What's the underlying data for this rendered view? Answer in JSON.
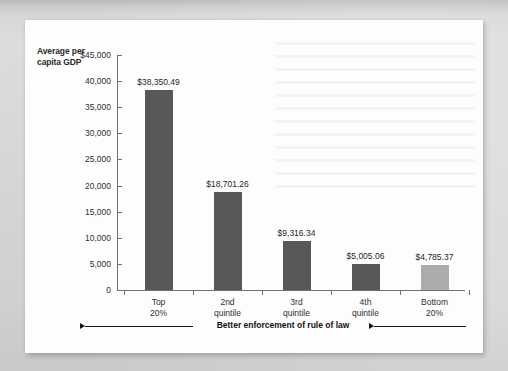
{
  "figure": {
    "y_axis_title": "Average per capita GDP",
    "annotation": "Better enforcement of rule of law"
  },
  "chart_data": {
    "type": "bar",
    "title": "",
    "xlabel": "Better enforcement of rule of law",
    "ylabel": "Average per capita GDP",
    "categories": [
      "Top 20%",
      "2nd quintile",
      "3rd quintile",
      "4th quintile",
      "Bottom 20%"
    ],
    "category_lines": [
      [
        "Top",
        "20%"
      ],
      [
        "2nd",
        "quintile"
      ],
      [
        "3rd",
        "quintile"
      ],
      [
        "4th",
        "quintile"
      ],
      [
        "Bottom",
        "20%"
      ]
    ],
    "values": [
      38350.49,
      18701.26,
      9316.34,
      5005.06,
      4785.37
    ],
    "value_labels": [
      "$38,350.49",
      "$18,701.26",
      "$9,316.34",
      "$5,005.06",
      "$4,785.37"
    ],
    "bar_colors": [
      "#585858",
      "#585858",
      "#585858",
      "#585858",
      "#acacac"
    ],
    "ylim": [
      0,
      45000
    ],
    "ytick_values": [
      45000,
      40000,
      35000,
      30000,
      25000,
      20000,
      15000,
      10000,
      5000,
      0
    ],
    "ytick_labels": [
      "$45,000",
      "40,000",
      "35,000",
      "30,000",
      "25,000",
      "20,000",
      "15,000",
      "10,000",
      "5,000",
      "0"
    ],
    "grid": false,
    "legend": false
  }
}
